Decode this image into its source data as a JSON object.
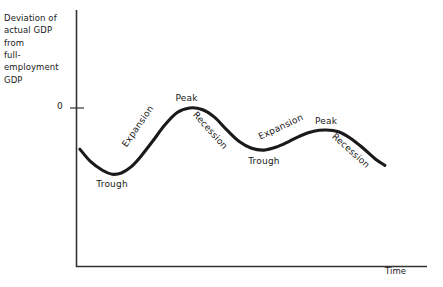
{
  "figure": {
    "background_color": "#ffffff",
    "ink_color": "#1a1a1a"
  },
  "axes": {
    "y_title": "Deviation of\nactual GDP from\nfull-employment\nGDP",
    "x_title": "Time",
    "y_tick_labels": [
      "0"
    ],
    "axis_color": "#333333"
  },
  "chart_data": {
    "type": "line",
    "title": "",
    "xlabel": "Time",
    "ylabel": "Deviation of actual GDP from full-employment GDP",
    "xlim": [
      0,
      100
    ],
    "ylim": [
      -28,
      6
    ],
    "grid": false,
    "legend": "none",
    "yticks": [
      0
    ],
    "ytick_labels": [
      "0"
    ],
    "xticks": [],
    "series": [
      {
        "name": "Deviation of actual GDP from full-employment GDP",
        "x": [
          0.6,
          4,
          8,
          11,
          14,
          17,
          20,
          24,
          28,
          32,
          36,
          40,
          44,
          48,
          52,
          56,
          60,
          64,
          68,
          72,
          76,
          80,
          84,
          88,
          92,
          96,
          99
        ],
        "y": [
          -13.5,
          -17.5,
          -20.5,
          -21.7,
          -21.3,
          -19.4,
          -16.2,
          -11.0,
          -5.6,
          -1.5,
          0.0,
          -0.5,
          -3.0,
          -7.2,
          -11.0,
          -13.2,
          -13.8,
          -12.8,
          -11.0,
          -9.0,
          -7.6,
          -7.2,
          -7.8,
          -10.0,
          -13.2,
          -16.8,
          -18.8
        ]
      }
    ],
    "annotations": [
      {
        "text": "Trough",
        "x": 11,
        "y": -25.0,
        "rotation_deg": 0,
        "phase": "trough"
      },
      {
        "text": "Expansion",
        "x": 22.5,
        "y": -12.5,
        "rotation_deg": -55,
        "phase": "expansion"
      },
      {
        "text": "Peak",
        "x": 35,
        "y": 3.2,
        "rotation_deg": 0,
        "phase": "peak"
      },
      {
        "text": "Recession",
        "x": 45,
        "y": -1.5,
        "rotation_deg": 48,
        "phase": "recession"
      },
      {
        "text": "Trough",
        "x": 60,
        "y": -17.5,
        "rotation_deg": 0,
        "phase": "trough"
      },
      {
        "text": "Expansion",
        "x": 66,
        "y": -9.5,
        "rotation_deg": -25,
        "phase": "expansion"
      },
      {
        "text": "Peak",
        "x": 80,
        "y": -4.2,
        "rotation_deg": 0,
        "phase": "peak"
      },
      {
        "text": "Recession",
        "x": 90,
        "y": -9.0,
        "rotation_deg": 42,
        "phase": "recession"
      }
    ]
  }
}
